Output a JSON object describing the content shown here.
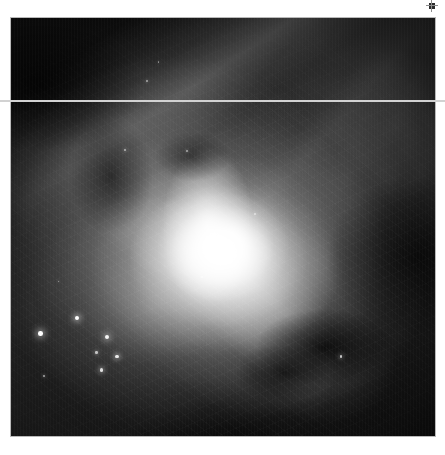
{
  "view": {
    "background_color": "#ffffff",
    "width": 445,
    "height": 455
  },
  "image": {
    "name": "nebula-grayscale-image",
    "alt_text": "Grayscale astronomical image of an emission nebula",
    "frame": {
      "x": 10,
      "y": 17,
      "width": 426,
      "height": 420
    },
    "border_color": "#b9b9b9",
    "colorspace": "grayscale",
    "black_point": "#050505",
    "white_point": "#ffffff",
    "features": [
      {
        "name": "bright-core",
        "label": "Bright core",
        "x_pct": 50,
        "y_pct": 54
      },
      {
        "name": "bright-bar",
        "label": "Diagonal ionization bar",
        "x_pct": 33,
        "y_pct": 76
      },
      {
        "name": "dark-lane-upper-left",
        "label": "Dark absorption lane",
        "x_pct": 14,
        "y_pct": 22
      },
      {
        "name": "dark-lane-lower-right",
        "label": "Dark absorption lane",
        "x_pct": 70,
        "y_pct": 74
      },
      {
        "name": "faint-plume-right",
        "label": "Faint plume",
        "x_pct": 74,
        "y_pct": 40
      }
    ]
  },
  "stars": [
    {
      "name": "star-1",
      "x_pct": 15.5,
      "y_pct": 71.8,
      "size": 4.2,
      "brightness": 1.0
    },
    {
      "name": "star-2",
      "x_pct": 7.0,
      "y_pct": 75.5,
      "size": 4.6,
      "brightness": 1.0
    },
    {
      "name": "star-3",
      "x_pct": 22.6,
      "y_pct": 76.4,
      "size": 4.0,
      "brightness": 0.95
    },
    {
      "name": "star-4",
      "x_pct": 25.0,
      "y_pct": 81.0,
      "size": 3.6,
      "brightness": 0.9
    },
    {
      "name": "star-5",
      "x_pct": 20.2,
      "y_pct": 80.0,
      "size": 2.4,
      "brightness": 0.7
    },
    {
      "name": "star-6",
      "x_pct": 21.4,
      "y_pct": 84.2,
      "size": 3.2,
      "brightness": 0.85
    },
    {
      "name": "star-7",
      "x_pct": 7.8,
      "y_pct": 85.6,
      "size": 2.0,
      "brightness": 0.6
    },
    {
      "name": "star-8",
      "x_pct": 77.8,
      "y_pct": 81.0,
      "size": 2.6,
      "brightness": 0.75
    },
    {
      "name": "star-9",
      "x_pct": 27.0,
      "y_pct": 31.5,
      "size": 2.0,
      "brightness": 0.6
    },
    {
      "name": "star-10",
      "x_pct": 32.0,
      "y_pct": 15.0,
      "size": 1.8,
      "brightness": 0.55
    },
    {
      "name": "star-11",
      "x_pct": 41.6,
      "y_pct": 31.8,
      "size": 1.8,
      "brightness": 0.55
    },
    {
      "name": "star-12",
      "x_pct": 45.0,
      "y_pct": 62.0,
      "size": 1.6,
      "brightness": 0.5
    },
    {
      "name": "star-13",
      "x_pct": 57.6,
      "y_pct": 46.8,
      "size": 1.8,
      "brightness": 0.55
    },
    {
      "name": "star-14",
      "x_pct": 11.2,
      "y_pct": 63.0,
      "size": 1.6,
      "brightness": 0.5
    },
    {
      "name": "star-15",
      "x_pct": 34.8,
      "y_pct": 10.5,
      "size": 1.4,
      "brightness": 0.45
    }
  ],
  "artifacts": {
    "scanline": {
      "name": "horizontal-scanline-artifact",
      "y": 100,
      "height": 2,
      "color": "#d2d2d2"
    },
    "corner_marker": {
      "name": "corner-marker",
      "x": 429,
      "y": 3,
      "size": 6,
      "color": "#2a2a2a"
    }
  }
}
